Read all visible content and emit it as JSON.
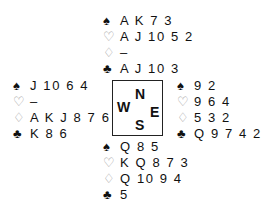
{
  "suits": {
    "spades": "♠",
    "hearts": "♡",
    "diamonds": "♢",
    "clubs": "♣"
  },
  "compass": {
    "north": "N",
    "west": "W",
    "east": "E",
    "south": "S"
  },
  "hands": {
    "north": {
      "spades": "A K 7 3",
      "hearts": "A J 10 5 2",
      "diamonds": "–",
      "clubs": "A J 10 3"
    },
    "west": {
      "spades": "J 10 6 4",
      "hearts": "–",
      "diamonds": "A K J 8 7 6",
      "clubs": "K 8 6"
    },
    "east": {
      "spades": "9 2",
      "hearts": "9 6 4",
      "diamonds": "5 3 2",
      "clubs": "Q 9 7 4 2"
    },
    "south": {
      "spades": "Q 8 5",
      "hearts": "K Q 8 7 3",
      "diamonds": "Q 10 9 4",
      "clubs": "5"
    }
  },
  "colors": {
    "text": "#111111",
    "outline_suit": "#9a9a9a",
    "background": "#ffffff"
  }
}
